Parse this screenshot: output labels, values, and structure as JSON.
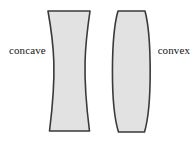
{
  "figure": {
    "background_color": "#ffffff",
    "width": 195,
    "height": 141
  },
  "labels": {
    "left": "concave",
    "right": "convex"
  },
  "shapes": {
    "concave_lens": {
      "name": "concave-lens",
      "description": "biconcave lens cross-section, flat top and bottom edges, inward-curving left and right sides",
      "fill_color": "#e2e2e2",
      "stroke_color": "#3a3a3a",
      "stroke_width": 1.6,
      "top_left_x": 48,
      "top_right_x": 90,
      "bottom_left_x": 48,
      "bottom_right_x": 90,
      "waist_left_x": 58,
      "waist_right_x": 80,
      "top_y": 11,
      "bottom_y": 131
    },
    "convex_lens": {
      "name": "convex-lens",
      "description": "biconvex lens cross-section, truncated flat top and bottom edges, outward-curving left and right sides",
      "fill_color": "#e2e2e2",
      "stroke_color": "#3a3a3a",
      "stroke_width": 1.6,
      "top_left_x": 118,
      "top_right_x": 145,
      "bottom_left_x": 118,
      "bottom_right_x": 145,
      "bulge_left_x": 108,
      "bulge_right_x": 152,
      "top_y": 11,
      "bottom_y": 132
    }
  }
}
